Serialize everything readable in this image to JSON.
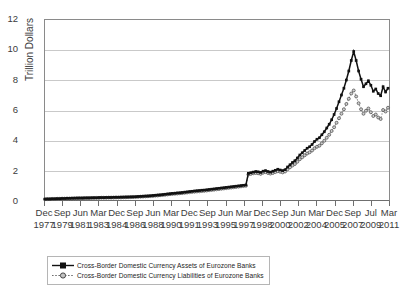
{
  "chart_data": {
    "type": "line",
    "title": "",
    "xlabel": "",
    "ylabel": "Trillion Dollars",
    "ylim": [
      0,
      12
    ],
    "yticks": [
      0,
      2,
      4,
      6,
      8,
      10,
      12
    ],
    "grid": true,
    "legend_position": "bottom-left",
    "x_tick_labels": [
      {
        "month": "Dec",
        "year": "1977"
      },
      {
        "month": "Sep",
        "year": "1979"
      },
      {
        "month": "Jun",
        "year": "1981"
      },
      {
        "month": "Mar",
        "year": "1983"
      },
      {
        "month": "Dec",
        "year": "1984"
      },
      {
        "month": "Sep",
        "year": "1986"
      },
      {
        "month": "Jun",
        "year": "1988"
      },
      {
        "month": "Mar",
        "year": "1990"
      },
      {
        "month": "Dec",
        "year": "1991"
      },
      {
        "month": "Sep",
        "year": "1993"
      },
      {
        "month": "Jun",
        "year": "1995"
      },
      {
        "month": "Mar",
        "year": "1997"
      },
      {
        "month": "Dec",
        "year": "1998"
      },
      {
        "month": "Sep",
        "year": "2000"
      },
      {
        "month": "Jun",
        "year": "2002"
      },
      {
        "month": "Mar",
        "year": "2004"
      },
      {
        "month": "Dec",
        "year": "2005"
      },
      {
        "month": "Sep",
        "year": "2007"
      },
      {
        "month": "Jul",
        "year": "2009"
      },
      {
        "month": "Mar",
        "year": "2011"
      }
    ],
    "x_start": "1977-12",
    "x_end": "2011-03",
    "x_interval": "quarterly",
    "series": [
      {
        "name": "Cross-Border Domestic Currency Assets of Eurozone Banks",
        "marker": "square",
        "line_style": "solid",
        "color": "#111111",
        "values": [
          0.06,
          0.07,
          0.07,
          0.08,
          0.08,
          0.09,
          0.09,
          0.1,
          0.1,
          0.11,
          0.11,
          0.12,
          0.12,
          0.13,
          0.13,
          0.13,
          0.14,
          0.14,
          0.14,
          0.15,
          0.15,
          0.15,
          0.16,
          0.16,
          0.16,
          0.17,
          0.17,
          0.17,
          0.18,
          0.18,
          0.18,
          0.19,
          0.19,
          0.2,
          0.2,
          0.21,
          0.21,
          0.22,
          0.23,
          0.24,
          0.25,
          0.26,
          0.27,
          0.28,
          0.3,
          0.31,
          0.33,
          0.34,
          0.36,
          0.38,
          0.4,
          0.42,
          0.44,
          0.45,
          0.47,
          0.48,
          0.5,
          0.52,
          0.54,
          0.56,
          0.58,
          0.6,
          0.62,
          0.63,
          0.65,
          0.66,
          0.68,
          0.7,
          0.72,
          0.74,
          0.76,
          0.78,
          0.8,
          0.82,
          0.84,
          0.86,
          0.88,
          0.9,
          0.92,
          0.94,
          0.96,
          0.98,
          1.0,
          1.78,
          1.82,
          1.86,
          1.9,
          1.88,
          1.84,
          1.92,
          1.96,
          1.9,
          1.86,
          1.92,
          1.98,
          2.05,
          2.0,
          1.96,
          2.02,
          2.2,
          2.35,
          2.5,
          2.62,
          2.8,
          3.0,
          3.15,
          3.3,
          3.45,
          3.55,
          3.7,
          3.9,
          4.05,
          4.15,
          4.35,
          4.55,
          4.8,
          5.05,
          5.35,
          5.7,
          6.1,
          6.55,
          7.0,
          7.45,
          8.0,
          8.6,
          9.3,
          9.9,
          9.3,
          8.6,
          8.05,
          7.55,
          7.75,
          7.95,
          7.65,
          7.25,
          7.4,
          7.1,
          6.95,
          7.55,
          7.2,
          7.45
        ]
      },
      {
        "name": "Cross-Border Domestic Currency Liabilities of Eurozone Banks",
        "marker": "circle",
        "line_style": "dotted",
        "color": "#8f8f8f",
        "values": [
          0.05,
          0.06,
          0.06,
          0.07,
          0.07,
          0.08,
          0.08,
          0.09,
          0.09,
          0.1,
          0.1,
          0.1,
          0.11,
          0.11,
          0.12,
          0.12,
          0.12,
          0.13,
          0.13,
          0.13,
          0.14,
          0.14,
          0.14,
          0.15,
          0.15,
          0.15,
          0.16,
          0.16,
          0.16,
          0.17,
          0.17,
          0.17,
          0.18,
          0.18,
          0.19,
          0.19,
          0.2,
          0.2,
          0.21,
          0.22,
          0.23,
          0.24,
          0.25,
          0.26,
          0.27,
          0.29,
          0.3,
          0.32,
          0.33,
          0.35,
          0.37,
          0.39,
          0.4,
          0.42,
          0.43,
          0.45,
          0.46,
          0.48,
          0.5,
          0.52,
          0.54,
          0.55,
          0.57,
          0.58,
          0.6,
          0.61,
          0.63,
          0.65,
          0.67,
          0.69,
          0.71,
          0.73,
          0.75,
          0.77,
          0.79,
          0.81,
          0.83,
          0.85,
          0.87,
          0.89,
          0.91,
          0.93,
          0.95,
          1.7,
          1.74,
          1.78,
          1.8,
          1.78,
          1.74,
          1.82,
          1.86,
          1.8,
          1.76,
          1.8,
          1.86,
          1.92,
          1.88,
          1.84,
          1.9,
          2.05,
          2.18,
          2.3,
          2.4,
          2.55,
          2.72,
          2.85,
          2.98,
          3.1,
          3.18,
          3.3,
          3.45,
          3.55,
          3.62,
          3.78,
          3.95,
          4.15,
          4.35,
          4.6,
          4.85,
          5.15,
          5.45,
          5.75,
          6.05,
          6.4,
          6.75,
          7.1,
          7.3,
          6.9,
          6.45,
          6.05,
          5.75,
          5.95,
          6.1,
          5.85,
          5.6,
          5.7,
          5.5,
          5.4,
          6.0,
          5.9,
          6.15
        ]
      }
    ]
  },
  "legend": {
    "items": [
      {
        "label": "Cross-Border Domestic Currency Assets of Eurozone Banks"
      },
      {
        "label": "Cross-Border Domestic Currency Liabilities of Eurozone Banks"
      }
    ]
  }
}
